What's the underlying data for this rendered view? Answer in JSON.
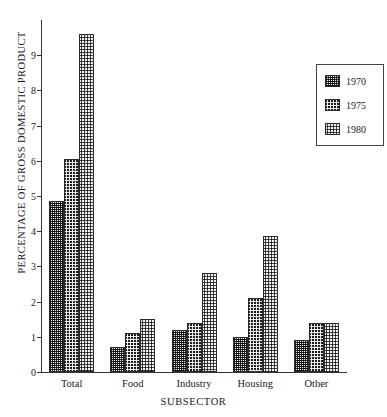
{
  "chart_data": {
    "type": "bar",
    "title": "",
    "xlabel": "SUBSECTOR",
    "ylabel": "PERCENTAGE OF GROSS DOMESTIC PRODUCT",
    "categories": [
      "Total",
      "Food",
      "Industry",
      "Housing",
      "Other"
    ],
    "series": [
      {
        "name": "1970",
        "values": [
          4.85,
          0.7,
          1.2,
          1.0,
          0.9
        ]
      },
      {
        "name": "1975",
        "values": [
          6.05,
          1.1,
          1.4,
          2.1,
          1.4
        ]
      },
      {
        "name": "1980",
        "values": [
          9.6,
          1.5,
          2.8,
          3.85,
          1.4
        ]
      }
    ],
    "ylim": [
      0,
      10
    ],
    "ytick_labels": [
      "0",
      "1",
      "2",
      "3",
      "4",
      "5",
      "6",
      "7",
      "8",
      "9"
    ],
    "ytick_values": [
      0,
      1,
      2,
      3,
      4,
      5,
      6,
      7,
      8,
      9
    ],
    "grid": false,
    "legend_position": "top-right",
    "legend_entries": [
      "1970",
      "1975",
      "1980"
    ],
    "colors": {
      "1970": "#8d8d8d",
      "1975": "#1d1d1d",
      "1980": "#f2f2f2",
      "axis": "#333333",
      "text": "#1a1a1a"
    }
  }
}
